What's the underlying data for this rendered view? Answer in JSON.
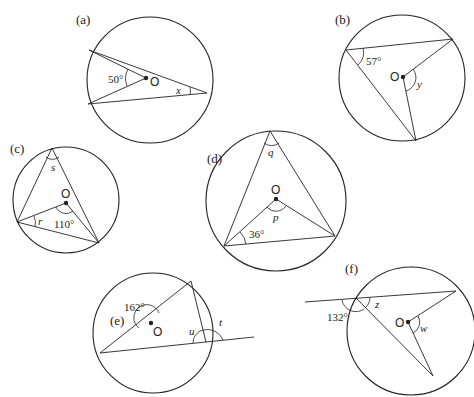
{
  "diagrams": [
    {
      "label": "(a)",
      "center_label": "O",
      "angles": [
        {
          "text": "50°"
        },
        {
          "text": "x"
        }
      ]
    },
    {
      "label": "(b)",
      "center_label": "O",
      "angles": [
        {
          "text": "57°"
        },
        {
          "text": "y"
        }
      ]
    },
    {
      "label": "(c)",
      "center_label": "O",
      "angles": [
        {
          "text": "s"
        },
        {
          "text": "r"
        },
        {
          "text": "110°"
        }
      ]
    },
    {
      "label": "(d)",
      "center_label": "O",
      "angles": [
        {
          "text": "q"
        },
        {
          "text": "p"
        },
        {
          "text": "36°"
        }
      ]
    },
    {
      "label": "(e)",
      "center_label": "O",
      "angles": [
        {
          "text": "162°"
        },
        {
          "text": "u"
        },
        {
          "text": "t"
        }
      ]
    },
    {
      "label": "(f)",
      "center_label": "O",
      "angles": [
        {
          "text": "132°"
        },
        {
          "text": "z"
        },
        {
          "text": "w"
        }
      ]
    }
  ],
  "colors": {
    "ink": "#222222",
    "background": "#ffffff"
  }
}
